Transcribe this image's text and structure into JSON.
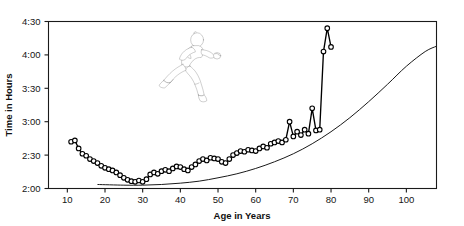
{
  "figure": {
    "title": "",
    "background_color": "#ffffff",
    "line_color": "#000000",
    "marker_fill": "#ffffff"
  },
  "axes": {
    "y_title": "Time in Hours",
    "x_title": "Age in Years",
    "y_ticks": [
      "2:00",
      "2:30",
      "3:00",
      "3:30",
      "4:00",
      "4:30"
    ],
    "x_ticks": [
      "10",
      "20",
      "30",
      "40",
      "50",
      "60",
      "70",
      "80",
      "90",
      "100"
    ]
  },
  "annotation": {
    "runner_icon": "runner-icon"
  },
  "chart_data": {
    "type": "line",
    "title": "",
    "xlabel": "Age in Years",
    "ylabel": "Time in Hours",
    "xlim": [
      5,
      108
    ],
    "ylim": [
      2.0,
      4.5
    ],
    "ylim_labels": [
      "2:00",
      "4:30"
    ],
    "y_tick_values": [
      2.0,
      2.5,
      3.0,
      3.5,
      4.0,
      4.5
    ],
    "y_tick_labels": [
      "2:00",
      "2:30",
      "3:00",
      "3:30",
      "4:00",
      "4:30"
    ],
    "x_tick_values": [
      10,
      20,
      30,
      40,
      50,
      60,
      70,
      80,
      90,
      100
    ],
    "x_tick_labels": [
      "10",
      "20",
      "30",
      "40",
      "50",
      "60",
      "70",
      "80",
      "90",
      "100"
    ],
    "grid": false,
    "legend": false,
    "y_axis_unit": "hours:minutes",
    "series": [
      {
        "name": "Mean marathon finishing time by age",
        "style": "line-with-open-circle-markers",
        "color": "#000000",
        "marker": "open-circle",
        "x": [
          11,
          12,
          13,
          14,
          15,
          16,
          17,
          18,
          19,
          20,
          21,
          22,
          23,
          24,
          25,
          26,
          27,
          28,
          29,
          30,
          31,
          32,
          33,
          34,
          35,
          36,
          37,
          38,
          39,
          40,
          41,
          42,
          43,
          44,
          45,
          46,
          47,
          48,
          49,
          50,
          51,
          52,
          53,
          54,
          55,
          56,
          57,
          58,
          59,
          60,
          61,
          62,
          63,
          64,
          65,
          66,
          67,
          68,
          69,
          70,
          71,
          72,
          73,
          74,
          75,
          76,
          77,
          78,
          79,
          80
        ],
        "y": [
          2.7,
          2.72,
          2.6,
          2.52,
          2.49,
          2.44,
          2.41,
          2.38,
          2.34,
          2.31,
          2.29,
          2.27,
          2.24,
          2.2,
          2.16,
          2.13,
          2.11,
          2.1,
          2.12,
          2.1,
          2.14,
          2.21,
          2.24,
          2.22,
          2.26,
          2.28,
          2.26,
          2.3,
          2.33,
          2.32,
          2.29,
          2.27,
          2.32,
          2.36,
          2.41,
          2.44,
          2.42,
          2.46,
          2.45,
          2.44,
          2.4,
          2.38,
          2.44,
          2.5,
          2.53,
          2.56,
          2.55,
          2.58,
          2.57,
          2.56,
          2.6,
          2.63,
          2.61,
          2.67,
          2.69,
          2.71,
          2.69,
          2.73,
          3.0,
          2.78,
          2.85,
          2.8,
          2.88,
          2.82,
          3.2,
          2.87,
          2.88,
          4.05,
          4.4,
          4.12
        ]
      },
      {
        "name": "Fitted trend curve",
        "style": "smooth-line",
        "color": "#1a1a1a",
        "marker": "none",
        "x": [
          18,
          25,
          30,
          35,
          40,
          45,
          50,
          55,
          60,
          65,
          70,
          75,
          80,
          85,
          90,
          95,
          100,
          105,
          108
        ],
        "y": [
          2.06,
          2.05,
          2.05,
          2.06,
          2.08,
          2.11,
          2.16,
          2.22,
          2.3,
          2.4,
          2.52,
          2.67,
          2.85,
          3.06,
          3.3,
          3.56,
          3.83,
          4.05,
          4.13
        ]
      }
    ],
    "annotations": [
      {
        "type": "icon",
        "name": "runner-icon",
        "x": 38,
        "y": 3.95,
        "description": "line-art silhouette of a running person"
      }
    ]
  }
}
